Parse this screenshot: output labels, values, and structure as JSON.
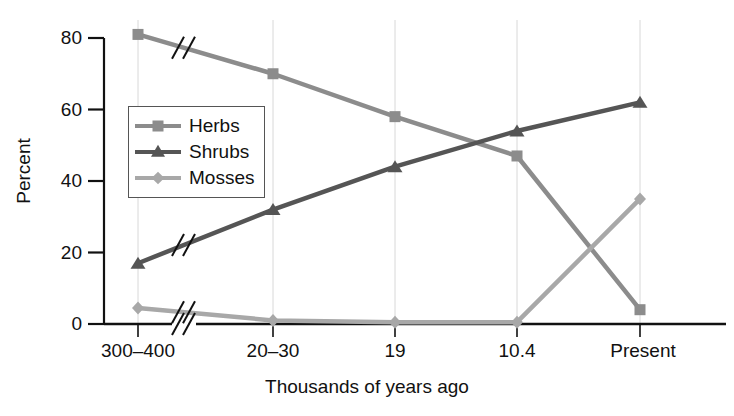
{
  "chart_data": {
    "type": "line",
    "title": "",
    "xlabel": "Thousands of years ago",
    "ylabel": "Percent",
    "categories": [
      "300–400",
      "20–30",
      "19",
      "10.4",
      "Present"
    ],
    "ylim": [
      0,
      80
    ],
    "yticks": [
      0,
      20,
      40,
      60,
      80
    ],
    "grid": "vertical gridlines at each category",
    "legend_position": "upper-left inside plot",
    "axis_break": "slash break marks between first and second category on all three series and on the x-axis",
    "series": [
      {
        "name": "Herbs",
        "marker": "square",
        "color": "#8c8c8c",
        "values": [
          81,
          70,
          58,
          47,
          4
        ]
      },
      {
        "name": "Shrubs",
        "marker": "triangle",
        "color": "#555555",
        "values": [
          17,
          32,
          44,
          54,
          62
        ]
      },
      {
        "name": "Mosses",
        "marker": "diamond",
        "color": "#a8a8a8",
        "values": [
          4.5,
          1,
          0.5,
          0.5,
          35
        ]
      }
    ]
  },
  "axes": {
    "y_tick_labels": [
      "0",
      "20",
      "40",
      "60",
      "80"
    ],
    "x_tick_labels": [
      "300–400",
      "20–30",
      "19",
      "10.4",
      "Present"
    ],
    "y_axis_title": "Percent",
    "x_axis_title": "Thousands of years ago"
  },
  "legend": {
    "items": [
      {
        "label": "Herbs"
      },
      {
        "label": "Shrubs"
      },
      {
        "label": "Mosses"
      }
    ]
  },
  "colors": {
    "herbs": "#8c8c8c",
    "shrubs": "#555555",
    "mosses": "#a8a8a8",
    "axis": "#111111",
    "gridline": "#d8d8d8",
    "background": "#ffffff"
  }
}
